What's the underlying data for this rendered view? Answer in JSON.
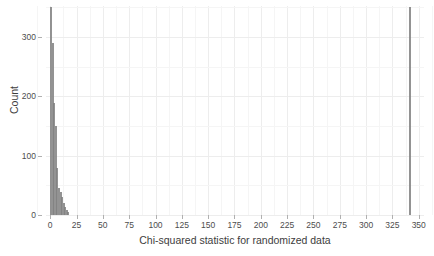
{
  "chart_data": {
    "type": "bar",
    "title": "",
    "subtitle": "",
    "xlabel": "Chi-squared statistic for randomized data",
    "ylabel": "Count",
    "xlim": [
      -4,
      355
    ],
    "ylim": [
      0,
      352
    ],
    "xticks": [
      0,
      25,
      50,
      75,
      100,
      125,
      150,
      175,
      200,
      225,
      250,
      275,
      300,
      325,
      350
    ],
    "xticklabels": [
      "0",
      "25",
      "50",
      "75",
      "100",
      "125",
      "150",
      "175",
      "200",
      "225",
      "250",
      "275",
      "300",
      "325",
      "350"
    ],
    "yticks": [
      0,
      100,
      200,
      300
    ],
    "yticklabels": [
      "0",
      "100",
      "200",
      "300"
    ],
    "grid": true,
    "grid_minor": true,
    "legend": "none",
    "bar_color": "#808080",
    "bin_width": 1.5,
    "categories": [
      0.8,
      2.3,
      3.8,
      5.3,
      6.8,
      8.3,
      9.8,
      11.3,
      12.8,
      14.3,
      15.8,
      17.3,
      342.0
    ],
    "values": [
      350,
      290,
      188,
      150,
      80,
      46,
      38,
      30,
      21,
      14,
      9,
      5,
      350
    ],
    "annotations": [
      "Dense cluster of randomized chi-squared values between 0 and about 18",
      "Isolated tall bar near chi-squared = 342 representing the observed statistic"
    ]
  },
  "axes": {
    "y_title": "Count",
    "x_title": "Chi-squared statistic for randomized data"
  }
}
